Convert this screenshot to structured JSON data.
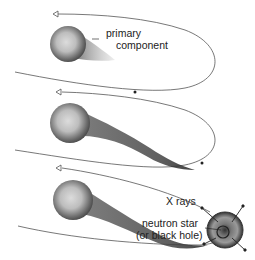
{
  "diagram": {
    "stages": [
      {
        "id": 1,
        "label_primary_line1": "primary",
        "label_primary_line2": "component"
      },
      {
        "id": 2
      },
      {
        "id": 3,
        "label_xrays": "X rays",
        "label_compact_line1": "neutron star",
        "label_compact_line2": "(or black hole)"
      }
    ],
    "colors": {
      "line": "#555555",
      "star_dark": "#4a4a4a",
      "star_light": "#d8d8d8",
      "background": "#ffffff"
    }
  }
}
